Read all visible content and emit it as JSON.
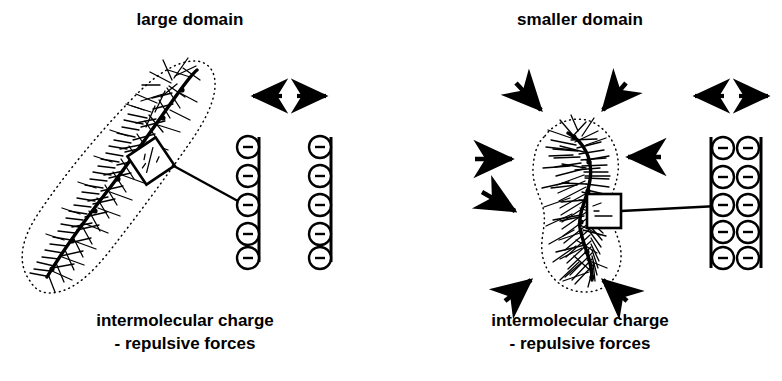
{
  "figure": {
    "width": 782,
    "height": 381,
    "background": "#ffffff",
    "ink_color": "#000000"
  },
  "panels": [
    {
      "id": "large-domain",
      "title": "large domain",
      "caption_line1": "intermolecular charge",
      "caption_line2": "- repulsive forces",
      "domain_shape": "elongated-capsule",
      "domain_orientation": "diagonal-lower-left-to-upper-right",
      "compression_arrows": 0,
      "expansion_arrows": 2,
      "charge_columns": 2,
      "charges_per_column": 5,
      "charge_symbol": "−",
      "charge_sign": "negative",
      "column_spacing": "wide"
    },
    {
      "id": "smaller-domain",
      "title": "smaller domain",
      "caption_line1": "intermolecular charge",
      "caption_line2": "- repulsive forces",
      "domain_shape": "peanut-hourglass",
      "domain_orientation": "vertical",
      "compression_arrows": 6,
      "expansion_arrows": 2,
      "charge_columns": 2,
      "charges_per_column": 5,
      "charge_symbol": "−",
      "charge_sign": "negative",
      "column_spacing": "narrow"
    }
  ],
  "legend": {
    "charge_glyph": "−",
    "callout_label": "magnified-chain-segment"
  }
}
